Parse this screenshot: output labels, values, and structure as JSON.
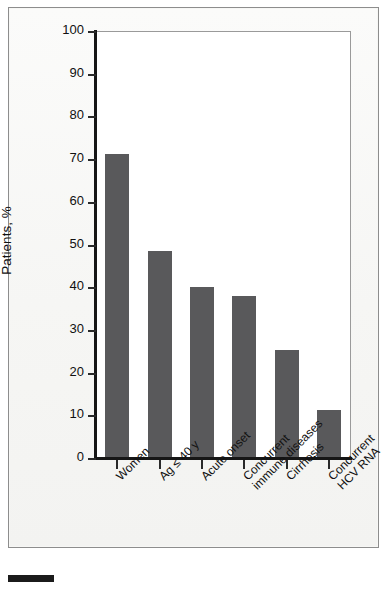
{
  "figure": {
    "background_color": "#f6f6f4",
    "frame_color": "#8d8d8d",
    "bar_color": "#59595b",
    "axis_color": "#161616"
  },
  "chart_data": {
    "type": "bar",
    "title": "",
    "subtitle": "",
    "xlabel": "",
    "ylabel": "Patients, %",
    "categories": [
      "Women",
      "Ag ≤ 40 y",
      "Acute onset",
      "Concurrent\nimmune diseases",
      "Cirrhosis",
      "Concurrent\nHCV RNA"
    ],
    "values": [
      71.2,
      48.5,
      40.0,
      38.0,
      25.3,
      11.2
    ],
    "ylim": [
      0,
      100
    ],
    "ytick_labels": [
      "0",
      "10",
      "20",
      "30",
      "40",
      "50",
      "60",
      "70",
      "80",
      "90",
      "100"
    ],
    "ytick_values": [
      0,
      10,
      20,
      30,
      40,
      50,
      60,
      70,
      80,
      90,
      100
    ],
    "grid": false,
    "legend": null,
    "legend_position": "none",
    "annotations": []
  },
  "footer": {
    "marker_label": ""
  }
}
